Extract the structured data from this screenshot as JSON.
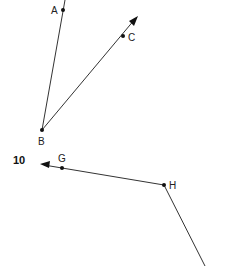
{
  "diagram": {
    "problem_number": "10",
    "colors": {
      "line": "#333333",
      "point": "#111111",
      "text": "#222222"
    },
    "figures": [
      {
        "name": "angle-ABC",
        "vertex": "B",
        "rays": [
          "BA",
          "BC"
        ]
      },
      {
        "name": "angle-GHx",
        "vertex": "H",
        "rays": [
          "HG",
          "H-down"
        ]
      }
    ],
    "points": {
      "A": {
        "label": "A",
        "x": 63,
        "y": 10
      },
      "B": {
        "label": "B",
        "x": 42,
        "y": 130
      },
      "C": {
        "label": "C",
        "x": 123,
        "y": 36
      },
      "G": {
        "label": "G",
        "x": 62,
        "y": 168
      },
      "H": {
        "label": "H",
        "x": 164,
        "y": 185
      }
    }
  }
}
